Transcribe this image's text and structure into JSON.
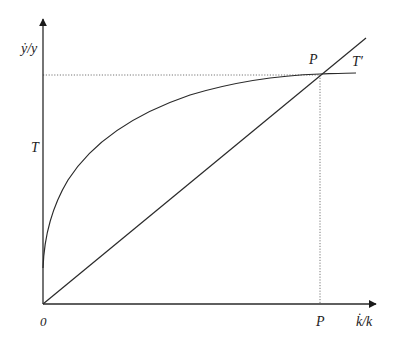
{
  "diagram": {
    "type": "economic-growth-diagram",
    "colors": {
      "line": "#2a2a2a",
      "guide": "#777777",
      "background": "#ffffff"
    },
    "axes": {
      "y_label": "ẏ/y",
      "x_label": "k̇/k",
      "origin_label": "0"
    },
    "curves": [
      {
        "id": "T-curve",
        "label": "T",
        "shape": "concave increasing curve"
      },
      {
        "id": "T-prime-line",
        "label": "T′",
        "shape": "straight line through origin"
      }
    ],
    "intersection": {
      "label": "P",
      "x_axis_label": "P"
    }
  }
}
